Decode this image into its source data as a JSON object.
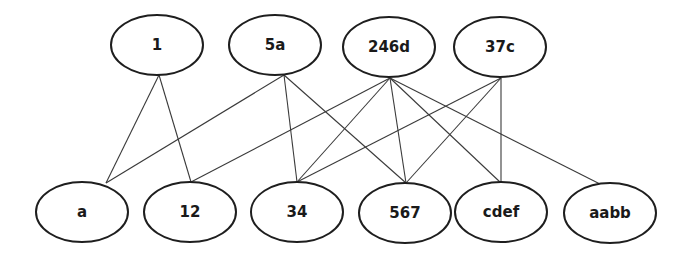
{
  "diagram": {
    "type": "bipartite-graph",
    "top_nodes": [
      {
        "id": "1",
        "label": "1",
        "cx": 157,
        "cy": 45,
        "rx": 46,
        "ry": 30
      },
      {
        "id": "5a",
        "label": "5a",
        "cx": 275,
        "cy": 45,
        "rx": 46,
        "ry": 30
      },
      {
        "id": "246d",
        "label": "246d",
        "cx": 389,
        "cy": 47,
        "rx": 46,
        "ry": 30
      },
      {
        "id": "37c",
        "label": "37c",
        "cx": 500,
        "cy": 47,
        "rx": 46,
        "ry": 30
      }
    ],
    "bottom_nodes": [
      {
        "id": "a",
        "label": "a",
        "cx": 82,
        "cy": 212,
        "rx": 46,
        "ry": 30
      },
      {
        "id": "12",
        "label": "12",
        "cx": 190,
        "cy": 212,
        "rx": 46,
        "ry": 30
      },
      {
        "id": "34",
        "label": "34",
        "cx": 297,
        "cy": 212,
        "rx": 46,
        "ry": 30
      },
      {
        "id": "567",
        "label": "567",
        "cx": 405,
        "cy": 213,
        "rx": 46,
        "ry": 30
      },
      {
        "id": "cdef",
        "label": "cdef",
        "cx": 501,
        "cy": 212,
        "rx": 46,
        "ry": 30
      },
      {
        "id": "aabb",
        "label": "aabb",
        "cx": 610,
        "cy": 213,
        "rx": 46,
        "ry": 30
      }
    ],
    "edges": [
      {
        "from": "1",
        "to": "a",
        "x1": 159,
        "y1": 75,
        "x2": 106,
        "y2": 183
      },
      {
        "from": "1",
        "to": "12",
        "x1": 159,
        "y1": 75,
        "x2": 191,
        "y2": 182
      },
      {
        "from": "5a",
        "to": "a",
        "x1": 284,
        "y1": 75,
        "x2": 106,
        "y2": 183
      },
      {
        "from": "5a",
        "to": "34",
        "x1": 284,
        "y1": 75,
        "x2": 297,
        "y2": 182
      },
      {
        "from": "5a",
        "to": "567",
        "x1": 284,
        "y1": 75,
        "x2": 406,
        "y2": 183
      },
      {
        "from": "246d",
        "to": "12",
        "x1": 390,
        "y1": 78,
        "x2": 191,
        "y2": 182
      },
      {
        "from": "246d",
        "to": "34",
        "x1": 390,
        "y1": 78,
        "x2": 297,
        "y2": 182
      },
      {
        "from": "246d",
        "to": "567",
        "x1": 390,
        "y1": 78,
        "x2": 406,
        "y2": 183
      },
      {
        "from": "246d",
        "to": "cdef",
        "x1": 390,
        "y1": 78,
        "x2": 501,
        "y2": 183
      },
      {
        "from": "246d",
        "to": "aabb",
        "x1": 390,
        "y1": 78,
        "x2": 600,
        "y2": 184
      },
      {
        "from": "37c",
        "to": "34",
        "x1": 501,
        "y1": 78,
        "x2": 297,
        "y2": 182
      },
      {
        "from": "37c",
        "to": "567",
        "x1": 501,
        "y1": 78,
        "x2": 406,
        "y2": 183
      },
      {
        "from": "37c",
        "to": "cdef",
        "x1": 501,
        "y1": 78,
        "x2": 501,
        "y2": 183
      }
    ]
  }
}
